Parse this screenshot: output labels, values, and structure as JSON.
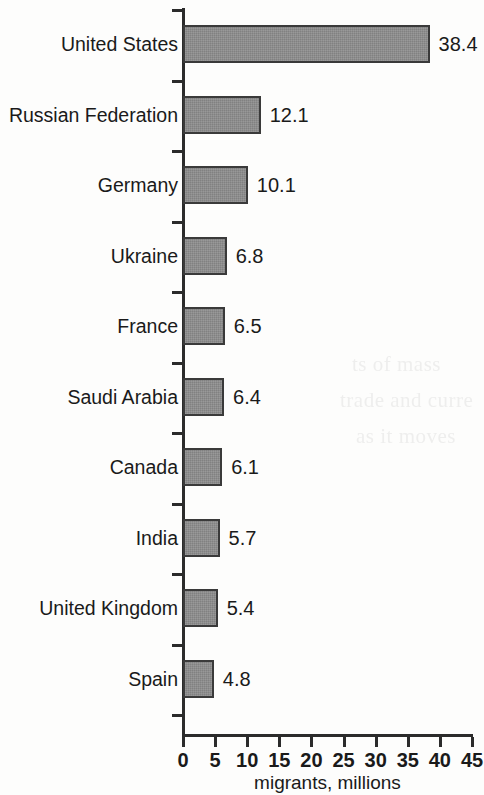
{
  "chart_data": {
    "type": "bar",
    "orientation": "horizontal",
    "title": "",
    "xlabel": "migrants, millions",
    "ylabel": "",
    "categories": [
      "United States",
      "Russian Federation",
      "Germany",
      "Ukraine",
      "France",
      "Saudi Arabia",
      "Canada",
      "India",
      "United Kingdom",
      "Spain"
    ],
    "values": [
      38.4,
      12.1,
      10.1,
      6.8,
      6.5,
      6.4,
      6.1,
      5.7,
      5.4,
      4.8
    ],
    "value_labels": [
      "38.4",
      "12.1",
      "10.1",
      "6.8",
      "6.5",
      "6.4",
      "6.1",
      "5.7",
      "5.4",
      "4.8"
    ],
    "xlim": [
      0,
      45
    ],
    "xticks": [
      0,
      5,
      10,
      15,
      20,
      25,
      30,
      35,
      40,
      45
    ],
    "xtick_labels": [
      "0",
      "5",
      "10",
      "15",
      "20",
      "25",
      "30",
      "35",
      "40",
      "45"
    ],
    "grid": false,
    "legend": null,
    "bar_color": "#8d8d8d",
    "bar_border_color": "#3a3a3a",
    "axis_color": "#2b2b2b",
    "background_color": "#ffffff"
  },
  "ghost_text": [
    "ts of mass",
    "trade and curre",
    "as it moves"
  ]
}
